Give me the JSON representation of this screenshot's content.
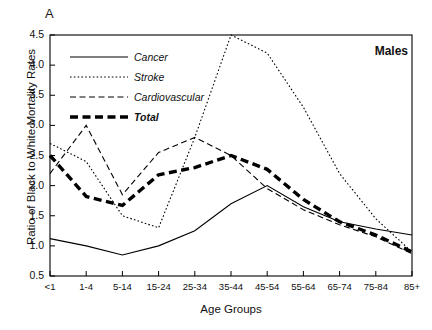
{
  "figure": {
    "panel_label": "A",
    "group_label": "Males",
    "xlabel": "Age Groups",
    "ylabel": "Ratio of Black to White Mortality Rates"
  },
  "legend": {
    "position": "top-left",
    "entries": [
      {
        "label": "Cancer",
        "style": "solid"
      },
      {
        "label": "Stroke",
        "style": "dotted"
      },
      {
        "label": "Cardiovascular",
        "style": "dashed"
      },
      {
        "label": "Total",
        "style": "thick-dashed"
      }
    ]
  },
  "axes": {
    "y_ticks": [
      "0.5",
      "1.0",
      "1.5",
      "2.0",
      "2.5",
      "3.0",
      "3.5",
      "4.0",
      "4.5"
    ],
    "x_ticks": [
      "<1",
      "1-4",
      "5-14",
      "15-24",
      "25-34",
      "35-44",
      "45-54",
      "55-64",
      "65-74",
      "75-84",
      "85+"
    ]
  },
  "chart_data": {
    "type": "line",
    "title": "",
    "subtitle": "Males",
    "xlabel": "Age Groups",
    "ylabel": "Ratio of Black to White Mortality Rates",
    "categories": [
      "<1",
      "1-4",
      "5-14",
      "15-24",
      "25-34",
      "35-44",
      "45-54",
      "55-64",
      "65-74",
      "75-84",
      "85+"
    ],
    "ylim": [
      0.5,
      4.5
    ],
    "ytick_step": 0.5,
    "grid": false,
    "legend_position": "top-left",
    "series": [
      {
        "name": "Cancer",
        "style": "solid",
        "values": [
          1.12,
          1.0,
          0.85,
          1.0,
          1.25,
          1.7,
          2.0,
          1.65,
          1.4,
          1.28,
          1.18
        ]
      },
      {
        "name": "Stroke",
        "style": "dotted",
        "values": [
          2.7,
          2.4,
          1.5,
          1.3,
          2.8,
          4.5,
          4.2,
          3.3,
          2.2,
          1.45,
          0.9
        ]
      },
      {
        "name": "Cardiovascular",
        "style": "dashed",
        "values": [
          2.2,
          3.0,
          1.85,
          2.55,
          2.8,
          2.5,
          1.95,
          1.6,
          1.35,
          1.15,
          0.87
        ]
      },
      {
        "name": "Total",
        "style": "thick-dashed",
        "values": [
          2.5,
          1.82,
          1.67,
          2.18,
          2.3,
          2.5,
          2.27,
          1.77,
          1.4,
          1.18,
          0.9
        ]
      }
    ]
  }
}
